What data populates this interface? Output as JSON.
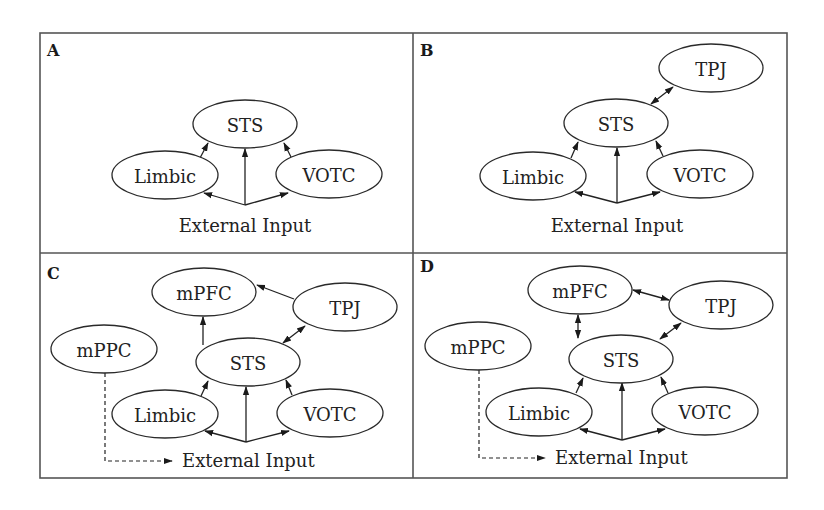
{
  "figure": {
    "panels": [
      {
        "letter": "A",
        "nodes": [
          "STS",
          "Limbic",
          "VOTC"
        ],
        "input_label": "External Input",
        "connections": [
          {
            "from": "External Input",
            "to": "STS",
            "type": "directed"
          },
          {
            "from": "External Input",
            "to": "Limbic",
            "type": "directed"
          },
          {
            "from": "External Input",
            "to": "VOTC",
            "type": "directed"
          },
          {
            "from": "Limbic",
            "to": "STS",
            "type": "directed"
          },
          {
            "from": "VOTC",
            "to": "STS",
            "type": "directed"
          }
        ]
      },
      {
        "letter": "B",
        "nodes": [
          "TPJ",
          "STS",
          "Limbic",
          "VOTC"
        ],
        "input_label": "External Input",
        "connections": [
          {
            "from": "External Input",
            "to": "STS",
            "type": "directed"
          },
          {
            "from": "External Input",
            "to": "Limbic",
            "type": "directed"
          },
          {
            "from": "External Input",
            "to": "VOTC",
            "type": "directed"
          },
          {
            "from": "Limbic",
            "to": "STS",
            "type": "directed"
          },
          {
            "from": "VOTC",
            "to": "STS",
            "type": "directed"
          },
          {
            "from": "STS",
            "to": "TPJ",
            "type": "bidirectional"
          }
        ]
      },
      {
        "letter": "C",
        "nodes": [
          "mPFC",
          "TPJ",
          "mPPC",
          "STS",
          "Limbic",
          "VOTC"
        ],
        "input_label": "External Input",
        "connections": [
          {
            "from": "External Input",
            "to": "STS",
            "type": "directed"
          },
          {
            "from": "External Input",
            "to": "Limbic",
            "type": "directed"
          },
          {
            "from": "External Input",
            "to": "VOTC",
            "type": "directed"
          },
          {
            "from": "Limbic",
            "to": "STS",
            "type": "directed"
          },
          {
            "from": "VOTC",
            "to": "STS",
            "type": "directed"
          },
          {
            "from": "STS",
            "to": "TPJ",
            "type": "bidirectional"
          },
          {
            "from": "STS",
            "to": "mPFC",
            "type": "directed"
          },
          {
            "from": "TPJ",
            "to": "mPFC",
            "type": "directed"
          },
          {
            "from": "mPPC",
            "to": "External Input",
            "type": "dashed"
          }
        ]
      },
      {
        "letter": "D",
        "nodes": [
          "mPFC",
          "TPJ",
          "mPPC",
          "STS",
          "Limbic",
          "VOTC"
        ],
        "input_label": "External Input",
        "connections": [
          {
            "from": "External Input",
            "to": "STS",
            "type": "directed"
          },
          {
            "from": "External Input",
            "to": "Limbic",
            "type": "directed"
          },
          {
            "from": "External Input",
            "to": "VOTC",
            "type": "directed"
          },
          {
            "from": "Limbic",
            "to": "STS",
            "type": "directed"
          },
          {
            "from": "VOTC",
            "to": "STS",
            "type": "directed"
          },
          {
            "from": "STS",
            "to": "TPJ",
            "type": "bidirectional"
          },
          {
            "from": "STS",
            "to": "mPFC",
            "type": "bidirectional"
          },
          {
            "from": "mPFC",
            "to": "TPJ",
            "type": "bidirectional"
          },
          {
            "from": "mPPC",
            "to": "External Input",
            "type": "dashed"
          }
        ]
      }
    ]
  }
}
